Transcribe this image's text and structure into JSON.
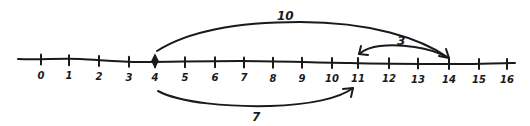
{
  "diagram": {
    "type": "number-line",
    "ink_color": "#1a1a1a",
    "background": "#ffffff",
    "axis": {
      "min": 0,
      "max": 16,
      "ticks": [
        {
          "value": 0,
          "label": "0",
          "x": 41
        },
        {
          "value": 1,
          "label": "1",
          "x": 69
        },
        {
          "value": 2,
          "label": "2",
          "x": 99
        },
        {
          "value": 3,
          "label": "3",
          "x": 129
        },
        {
          "value": 4,
          "label": "4",
          "x": 155
        },
        {
          "value": 5,
          "label": "5",
          "x": 185
        },
        {
          "value": 6,
          "label": "6",
          "x": 215
        },
        {
          "value": 7,
          "label": "7",
          "x": 244
        },
        {
          "value": 8,
          "label": "8",
          "x": 273
        },
        {
          "value": 9,
          "label": "9",
          "x": 302
        },
        {
          "value": 10,
          "label": "10",
          "x": 332
        },
        {
          "value": 11,
          "label": "11",
          "x": 358
        },
        {
          "value": 12,
          "label": "12",
          "x": 389
        },
        {
          "value": 13,
          "label": "13",
          "x": 418
        },
        {
          "value": 14,
          "label": "14",
          "x": 449
        },
        {
          "value": 15,
          "label": "15",
          "x": 479
        },
        {
          "value": 16,
          "label": "16",
          "x": 507
        }
      ]
    },
    "start_point": {
      "value": 4,
      "marker": "filled-dot"
    },
    "jumps": [
      {
        "from": 4,
        "to": 14,
        "label": "10",
        "position": "above",
        "direction": "right"
      },
      {
        "from": 14,
        "to": 11,
        "label": "3",
        "position": "above",
        "direction": "left"
      },
      {
        "from": 4,
        "to": 11,
        "label": "7",
        "position": "below",
        "direction": "right"
      }
    ]
  }
}
